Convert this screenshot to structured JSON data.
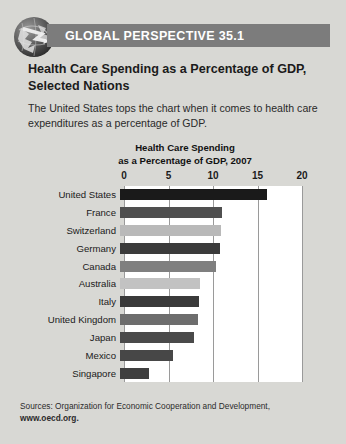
{
  "header": {
    "band_label": "GLOBAL PERSPECTIVE 35.1",
    "globe_icon": "globe-icon",
    "band_color": "#7c7c7c"
  },
  "box": {
    "title": "Health Care Spending as a Percentage of GDP, Selected Nations",
    "description": "The United States tops the chart when it comes to health care expenditures as a percentage of GDP."
  },
  "source": {
    "line1": "Sources: Organization for Economic Cooperation and Development,",
    "line2": "www.oecd.org."
  },
  "chart_data": {
    "type": "bar",
    "orientation": "horizontal",
    "title": "Health Care Spending as a Percentage of GDP, 2007",
    "title_line1": "Health Care Spending",
    "title_line2": "as a Percentage of GDP, 2007",
    "xlabel": "",
    "ylabel": "",
    "xlim": [
      0,
      20
    ],
    "xticks": [
      0,
      5,
      10,
      15,
      20
    ],
    "xtick_labels": [
      "0",
      "5",
      "10",
      "15",
      "20"
    ],
    "grid": true,
    "grid_axis": "x",
    "legend": false,
    "categories": [
      "United States",
      "France",
      "Switzerland",
      "Germany",
      "Canada",
      "Australia",
      "Italy",
      "United Kingdom",
      "Japan",
      "Mexico",
      "Singapore"
    ],
    "values": [
      16.5,
      11.5,
      11.3,
      11.2,
      10.8,
      9.0,
      8.9,
      8.8,
      8.3,
      5.9,
      3.3
    ],
    "bar_colors": [
      "#1a1a1a",
      "#4f4f4f",
      "#b9b9b9",
      "#3b3b3b",
      "#7f7f7f",
      "#c2c2c2",
      "#3a3a3a",
      "#6d6d6d",
      "#4a4a4a",
      "#474747",
      "#3f3f3f"
    ]
  }
}
